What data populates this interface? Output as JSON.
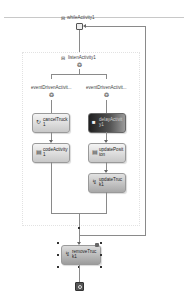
{
  "diagram": {
    "type": "sequential-workflow",
    "while_activity": {
      "label": "whileActivity1",
      "collapse_glyph": "⊟"
    },
    "listen_activity": {
      "label": "listenActivity1",
      "collapse_glyph": "⊟"
    },
    "branches": [
      {
        "label": "eventDrivenActivit...",
        "nodes": [
          {
            "label": "cancelTruck1",
            "icon": "event-handler-icon",
            "glyph": "↻",
            "style": "light"
          },
          {
            "label": "codeActivity1",
            "icon": "code-icon",
            "glyph": "▤",
            "style": "light"
          }
        ]
      },
      {
        "label": "eventDrivenActivit...",
        "nodes": [
          {
            "label": "delayActivity1",
            "icon": "delay-icon",
            "glyph": "■",
            "style": "dark"
          },
          {
            "label": "updatePosition",
            "icon": "code-icon",
            "glyph": "▤",
            "style": "light"
          },
          {
            "label": "updateTruck1",
            "icon": "event-handler-icon",
            "glyph": "↯",
            "style": "light"
          }
        ]
      }
    ],
    "final_node": {
      "label": "removeTruck1",
      "icon": "event-handler-icon",
      "glyph": "↯",
      "style": "selected"
    },
    "connector_glyph": "❂",
    "end_glyph": "◉"
  }
}
